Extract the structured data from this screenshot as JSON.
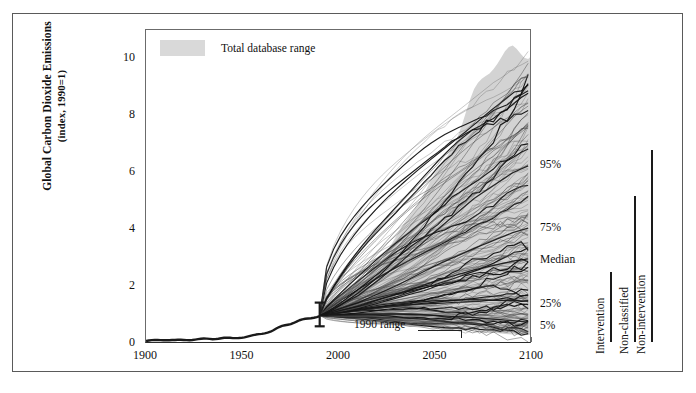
{
  "figure": {
    "y_axis_label_line1": "Global Carbon Dioxide Emissions",
    "y_axis_label_line2": "(index, 1990=1)",
    "legend_label": "Total database range",
    "annotation_1990": "1990 range"
  },
  "percentile_labels": [
    {
      "name": "p95",
      "text": "95%"
    },
    {
      "name": "p75",
      "text": "75%"
    },
    {
      "name": "median",
      "text": "Median"
    },
    {
      "name": "p25",
      "text": "25%"
    },
    {
      "name": "p5",
      "text": "5%"
    }
  ],
  "brackets": [
    {
      "name": "intervention",
      "text": "Intervention"
    },
    {
      "name": "non-classified",
      "text": "Non-classified"
    },
    {
      "name": "non-intervention",
      "text": "Non-intervention"
    }
  ],
  "colors": {
    "band": "#d3d3d3",
    "line": "#1a1a1a",
    "axis": "#6b6b6b",
    "frame": "#5a5a5a"
  },
  "chart_data": {
    "type": "line",
    "title": "",
    "xlabel": "",
    "ylabel": "Global Carbon Dioxide Emissions (index, 1990=1)",
    "xlim": [
      1900,
      2100
    ],
    "ylim": [
      0,
      11
    ],
    "xticks": [
      1900,
      1950,
      2000,
      2050,
      2100
    ],
    "yticks": [
      0,
      2,
      4,
      6,
      8,
      10
    ],
    "xminor_step": 10,
    "grid": false,
    "legend_position": "top-left",
    "legend_entries": [
      "Total database range"
    ],
    "annotations": [
      {
        "text": "1990 range",
        "x": 1990,
        "y": 1.0
      },
      {
        "text": "95%",
        "x": 2100,
        "y": 6.3
      },
      {
        "text": "75%",
        "x": 2100,
        "y": 4.1
      },
      {
        "text": "Median",
        "x": 2100,
        "y": 3.0
      },
      {
        "text": "25%",
        "x": 2100,
        "y": 1.5
      },
      {
        "text": "5%",
        "x": 2100,
        "y": 0.75
      }
    ],
    "historical": {
      "name": "Historical emissions",
      "x": [
        1900,
        1905,
        1910,
        1915,
        1920,
        1925,
        1930,
        1935,
        1940,
        1945,
        1950,
        1955,
        1960,
        1965,
        1970,
        1975,
        1980,
        1985,
        1990
      ],
      "y": [
        0.1,
        0.12,
        0.14,
        0.13,
        0.15,
        0.17,
        0.18,
        0.17,
        0.2,
        0.19,
        0.24,
        0.3,
        0.37,
        0.45,
        0.6,
        0.7,
        0.84,
        0.9,
        1.0
      ]
    },
    "range_band": {
      "name": "Total database range",
      "x": [
        1990,
        2000,
        2010,
        2020,
        2030,
        2040,
        2050,
        2060,
        2070,
        2080,
        2090,
        2100
      ],
      "upper": [
        1.0,
        1.35,
        1.95,
        2.7,
        3.7,
        4.85,
        6.1,
        7.3,
        8.5,
        9.5,
        10.4,
        11.0
      ],
      "lower": [
        1.0,
        1.0,
        0.95,
        0.88,
        0.8,
        0.72,
        0.62,
        0.55,
        0.48,
        0.42,
        0.36,
        0.3
      ]
    },
    "percentile_series": [
      {
        "name": "95th percentile",
        "x": [
          1990,
          2010,
          2030,
          2050,
          2070,
          2090,
          2100
        ],
        "y": [
          1.0,
          1.7,
          2.75,
          3.95,
          5.1,
          6.0,
          6.3
        ]
      },
      {
        "name": "75th percentile",
        "x": [
          1990,
          2010,
          2030,
          2050,
          2070,
          2090,
          2100
        ],
        "y": [
          1.0,
          1.45,
          2.05,
          2.75,
          3.35,
          3.9,
          4.1
        ]
      },
      {
        "name": "Median",
        "x": [
          1990,
          2010,
          2030,
          2050,
          2070,
          2090,
          2100
        ],
        "y": [
          1.0,
          1.32,
          1.75,
          2.2,
          2.6,
          2.9,
          3.0
        ]
      },
      {
        "name": "25th percentile",
        "x": [
          1990,
          2010,
          2030,
          2050,
          2070,
          2090,
          2100
        ],
        "y": [
          1.0,
          1.2,
          1.4,
          1.52,
          1.55,
          1.52,
          1.5
        ]
      },
      {
        "name": "5th percentile",
        "x": [
          1990,
          2010,
          2030,
          2050,
          2070,
          2090,
          2100
        ],
        "y": [
          1.0,
          1.05,
          1.05,
          1.0,
          0.92,
          0.82,
          0.75
        ]
      }
    ],
    "scenario_count": 180,
    "scenario_note": "Spaghetti of individual emissions scenarios fanning out from the 1990 index value of 1."
  }
}
